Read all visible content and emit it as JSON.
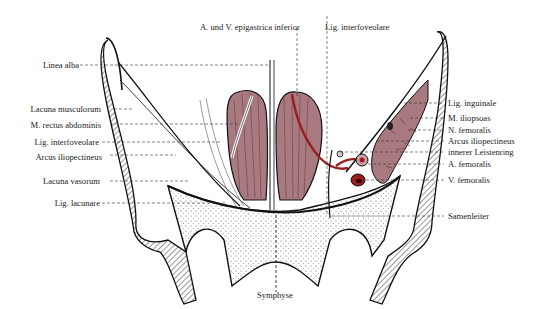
{
  "diagram": {
    "colors": {
      "muscle": "#a87a80",
      "muscle_dark": "#6e3a42",
      "vessel": "#9a1e1e",
      "bone_hatch": "#333333",
      "line": "#111111"
    },
    "labels_top": {
      "epigastrica": "A. und V. epigastrica inferior",
      "interfoveolare_top": "Lig. interfoveolare"
    },
    "labels_left": [
      {
        "id": "linea-alba",
        "text": "Linea alba"
      },
      {
        "id": "lacuna-musculorum",
        "text": "Lacuna musculorum"
      },
      {
        "id": "m-rectus-abdominis",
        "text": "M. rectus abdominis"
      },
      {
        "id": "lig-interfoveolare",
        "text": "Lig. interfoveolare"
      },
      {
        "id": "arcus-iliopectineus-left",
        "text": "Arcus iliopectineus"
      },
      {
        "id": "lacuna-vasorum",
        "text": "Lacuna vasorum"
      },
      {
        "id": "lig-lacunare",
        "text": "Lig. lacunare"
      }
    ],
    "labels_right": [
      {
        "id": "lig-inguinale",
        "text": "Lig. inguinale"
      },
      {
        "id": "m-iliopsoas",
        "text": "M. iliopsoas"
      },
      {
        "id": "n-femoralis",
        "text": "N. femoralis"
      },
      {
        "id": "arcus-iliopectineus-right",
        "text": "Arcus iliopectineus"
      },
      {
        "id": "innerer-leistenring",
        "text": "innerer Leistenring"
      },
      {
        "id": "a-femoralis",
        "text": "A. femoralis"
      },
      {
        "id": "v-femoralis",
        "text": "V. femoralis"
      },
      {
        "id": "samenleiter",
        "text": "Samenleiter"
      }
    ],
    "labels_bottom": {
      "symphyse": "Symphyse"
    }
  }
}
